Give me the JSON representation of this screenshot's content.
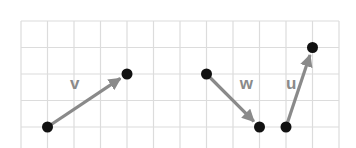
{
  "diagram": {
    "grid": {
      "columns": 12,
      "rows": 5,
      "line_color": "#dcdcdc"
    },
    "vector_color": "#8a8a8a",
    "point_color": "#111111",
    "vectors": [
      {
        "name": "v",
        "label": "v",
        "from": [
          1,
          4
        ],
        "to": [
          4,
          2
        ],
        "label_at": [
          1.85,
          2.55
        ]
      },
      {
        "name": "w",
        "label": "w",
        "from": [
          7,
          2
        ],
        "to": [
          9,
          4
        ],
        "label_at": [
          8.25,
          2.55
        ]
      },
      {
        "name": "u",
        "label": "u",
        "from": [
          10,
          4
        ],
        "to": [
          11,
          1
        ],
        "label_at": [
          10.0,
          2.55
        ]
      }
    ]
  }
}
